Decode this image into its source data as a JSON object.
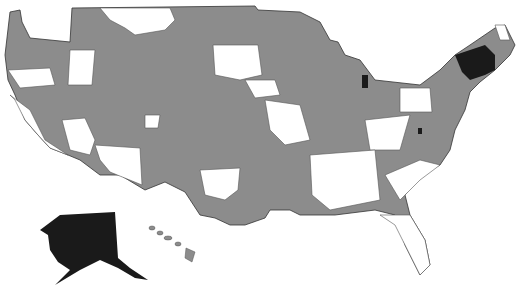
{
  "map": {
    "title": "",
    "region": "United States",
    "legend": [],
    "colors": {
      "covered": "#8c8c8c",
      "not_covered": "#ffffff",
      "highlighted": "#1a1a1a",
      "border": "#333333"
    },
    "highlighted_regions": [
      "Alaska",
      "Northern New England (NH/ME/VT)",
      "Central Michigan spot",
      "Central Virginia spot"
    ]
  }
}
